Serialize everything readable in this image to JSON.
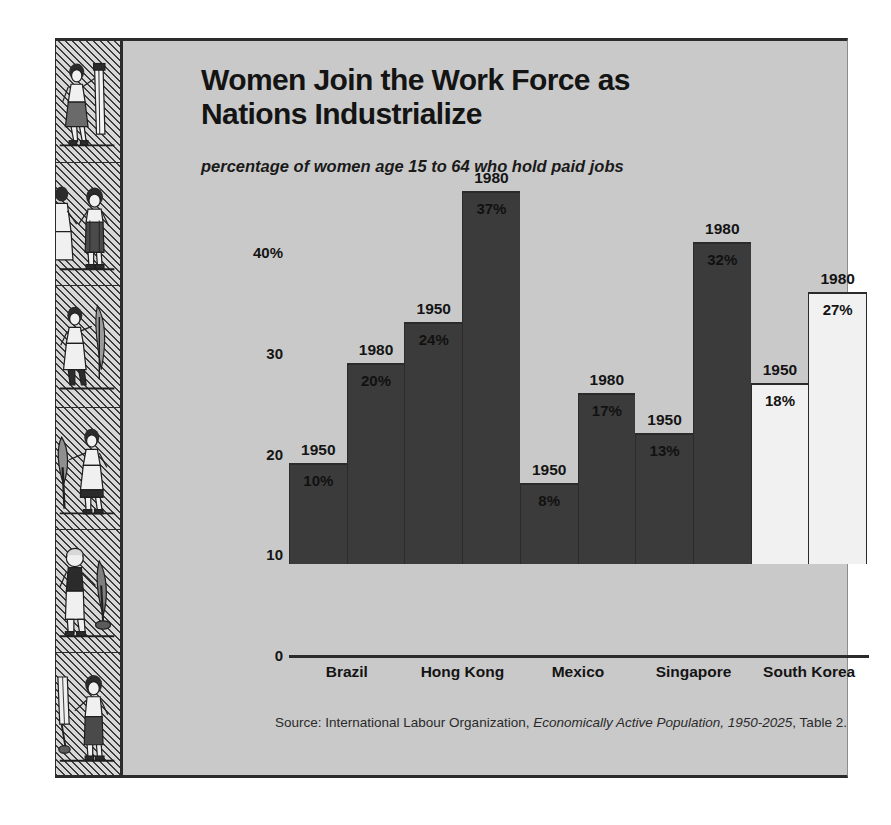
{
  "title": "Women Join the Work Force as Nations Industrialize",
  "subtitle": "percentage of women age 15 to 64 who hold paid jobs",
  "source": {
    "prefix": "Source: International Labour Organization, ",
    "italic1": "Economically Active Population,",
    "italic2": "1950-2025",
    "suffix": ", Table 2."
  },
  "colors": {
    "background": "#c9c9c9",
    "bar_dark": "#3b3b3b",
    "bar_light": "#f1f1f1",
    "ink": "#2b2b2b"
  },
  "sidebar": {
    "panels": [
      "woman-with-rolled-blueprint-icon",
      "woman-with-child-worker-icon",
      "woman-with-wheat-sheaf-icon",
      "woman-with-oar-icon",
      "woman-with-shovel-icon",
      "woman-with-tool-and-child-icon"
    ]
  },
  "chart_data": {
    "type": "bar",
    "title": "Women Join the Work Force as Nations Industrialize",
    "subtitle": "percentage of women age 15 to 64 who hold paid jobs",
    "xlabel": "",
    "ylabel": "",
    "ylim": [
      0,
      40
    ],
    "grid": false,
    "legend": "none",
    "yticks": [
      "0",
      "10",
      "20",
      "30",
      "40%"
    ],
    "ytick_values": [
      0,
      10,
      20,
      30,
      40
    ],
    "categories": [
      "Brazil",
      "Hong Kong",
      "Mexico",
      "Singapore",
      "South Korea"
    ],
    "series": [
      {
        "name": "1950",
        "values": [
          10,
          24,
          8,
          13,
          18
        ]
      },
      {
        "name": "1980",
        "values": [
          20,
          37,
          17,
          32,
          27
        ]
      }
    ],
    "bars": [
      {
        "category": "Brazil",
        "year": "1950",
        "value": 10,
        "label": "10%",
        "shade": "dark"
      },
      {
        "category": "Brazil",
        "year": "1980",
        "value": 20,
        "label": "20%",
        "shade": "dark"
      },
      {
        "category": "Hong Kong",
        "year": "1950",
        "value": 24,
        "label": "24%",
        "shade": "dark"
      },
      {
        "category": "Hong Kong",
        "year": "1980",
        "value": 37,
        "label": "37%",
        "shade": "dark"
      },
      {
        "category": "Mexico",
        "year": "1950",
        "value": 8,
        "label": "8%",
        "shade": "dark"
      },
      {
        "category": "Mexico",
        "year": "1980",
        "value": 17,
        "label": "17%",
        "shade": "dark"
      },
      {
        "category": "Singapore",
        "year": "1950",
        "value": 13,
        "label": "13%",
        "shade": "dark"
      },
      {
        "category": "Singapore",
        "year": "1980",
        "value": 32,
        "label": "32%",
        "shade": "dark"
      },
      {
        "category": "South Korea",
        "year": "1950",
        "value": 18,
        "label": "18%",
        "shade": "light"
      },
      {
        "category": "South Korea",
        "year": "1980",
        "value": 27,
        "label": "27%",
        "shade": "light"
      }
    ]
  }
}
